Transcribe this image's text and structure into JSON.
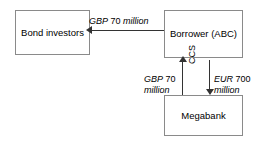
{
  "diagram": {
    "type": "flow-diagram",
    "nodes": [
      {
        "id": "bond-investors",
        "label": "Bond\ninvestors"
      },
      {
        "id": "borrower",
        "label": "Borrower\n(ABC)"
      },
      {
        "id": "megabank",
        "label": "Megabank"
      }
    ],
    "edges": [
      {
        "id": "bond-flow",
        "from": "borrower",
        "to": "bond-investors",
        "direction": "left",
        "currency": "GBP",
        "amount": "70",
        "unit": "million",
        "label": "GBP 70 million"
      },
      {
        "id": "gbp-leg",
        "from": "megabank",
        "to": "borrower",
        "direction": "up",
        "currency": "GBP",
        "amount": "70",
        "unit": "million",
        "label": "GBP 70 million"
      },
      {
        "id": "eur-leg",
        "from": "borrower",
        "to": "megabank",
        "direction": "down",
        "currency": "EUR",
        "amount": "700",
        "unit": "million",
        "label": "EUR 700 million"
      }
    ],
    "annotations": [
      {
        "id": "ccs",
        "label": "CCS",
        "rotation": "-90"
      }
    ],
    "colors": {
      "box_border": "#8a8a8a",
      "box_fill": "#ffffff",
      "connector": "#333333",
      "text": "#000000",
      "background": "#ffffff"
    }
  }
}
